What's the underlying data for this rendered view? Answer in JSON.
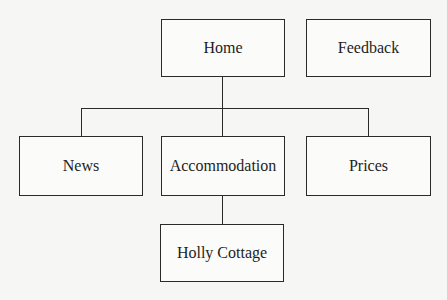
{
  "diagram": {
    "type": "site-map hierarchy",
    "nodes": [
      {
        "id": "home",
        "label": "Home"
      },
      {
        "id": "feedback",
        "label": "Feedback"
      },
      {
        "id": "news",
        "label": "News"
      },
      {
        "id": "accommodation",
        "label": "Accommodation"
      },
      {
        "id": "prices",
        "label": "Prices"
      },
      {
        "id": "holly-cottage",
        "label": "Holly Cottage"
      }
    ],
    "edges": [
      {
        "from": "home",
        "to": "news"
      },
      {
        "from": "home",
        "to": "accommodation"
      },
      {
        "from": "home",
        "to": "prices"
      },
      {
        "from": "accommodation",
        "to": "holly-cottage"
      }
    ],
    "colors": {
      "line": "#2a2a2a",
      "background": "#f6f6f4",
      "text": "#1e1e1e"
    }
  }
}
